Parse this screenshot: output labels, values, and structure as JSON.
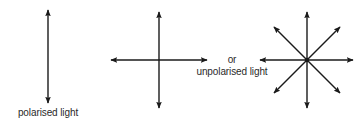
{
  "diagram": {
    "colors": {
      "stroke": "#1a1a1a",
      "text": "#2a2a2a",
      "background": "#ffffff"
    },
    "figures": [
      {
        "id": "polarised",
        "label": "polarised light",
        "description": "single vertical double-headed arrow",
        "arrows": [
          {
            "x1": 48,
            "y1": 10,
            "x2": 48,
            "y2": 103
          }
        ]
      },
      {
        "id": "cross",
        "description": "vertical and horizontal double-headed arrows",
        "arrows": [
          {
            "x1": 159,
            "y1": 12,
            "x2": 159,
            "y2": 108
          },
          {
            "x1": 111,
            "y1": 60,
            "x2": 207,
            "y2": 60
          }
        ]
      },
      {
        "id": "star",
        "description": "eight directions: vertical, horizontal and two diagonal double-headed arrows meeting at a centre dot",
        "center": {
          "x": 307,
          "y": 60
        },
        "arrows": [
          {
            "x1": 307,
            "y1": 12,
            "x2": 307,
            "y2": 108
          },
          {
            "x1": 260,
            "y1": 60,
            "x2": 353,
            "y2": 60
          },
          {
            "x1": 274,
            "y1": 27,
            "x2": 340,
            "y2": 93
          },
          {
            "x1": 340,
            "y1": 27,
            "x2": 274,
            "y2": 93
          }
        ]
      }
    ],
    "labels": {
      "polarised": "polarised light",
      "or": "or",
      "unpolarised": "unpolarised light"
    }
  }
}
